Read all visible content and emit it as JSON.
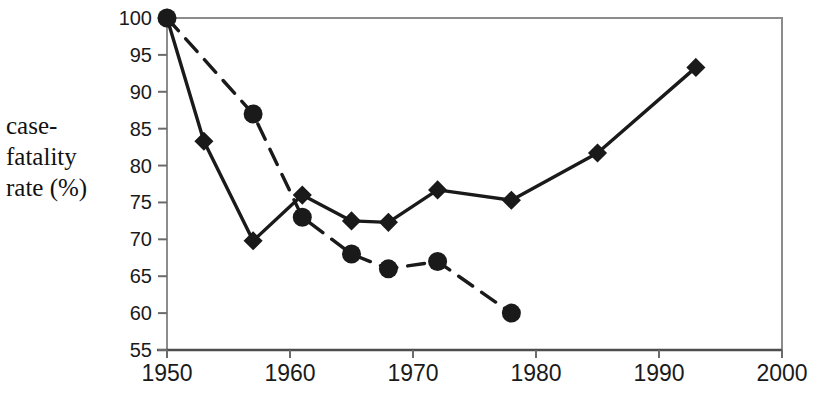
{
  "chart_data": {
    "type": "line",
    "title": "",
    "xlabel": "",
    "ylabel": "case-fatality rate (%)",
    "ylabel_lines": [
      "case-",
      "fatality",
      "rate (%)"
    ],
    "xlim": [
      1950,
      2000
    ],
    "ylim": [
      55,
      100
    ],
    "xticks": [
      1950,
      1960,
      1970,
      1980,
      1990,
      2000
    ],
    "xtick_labels": [
      "1950",
      "1960",
      "1970",
      "1980",
      "1990",
      "2000"
    ],
    "yticks": [
      55,
      60,
      65,
      70,
      75,
      80,
      85,
      90,
      95,
      100
    ],
    "ytick_labels": [
      "55",
      "60",
      "65",
      "70",
      "75",
      "80",
      "85",
      "90",
      "95",
      "100"
    ],
    "grid": false,
    "legend": "none",
    "series": [
      {
        "name": "solid-diamond-series",
        "marker": "diamond",
        "line_style": "solid",
        "color": "#1a1a1a",
        "points": [
          {
            "x": 1950,
            "y": 100
          },
          {
            "x": 1953,
            "y": 83.3
          },
          {
            "x": 1957,
            "y": 69.8
          },
          {
            "x": 1961,
            "y": 76.0
          },
          {
            "x": 1965,
            "y": 72.5
          },
          {
            "x": 1968,
            "y": 72.3
          },
          {
            "x": 1972,
            "y": 76.7
          },
          {
            "x": 1978,
            "y": 75.3
          },
          {
            "x": 1985,
            "y": 81.7
          },
          {
            "x": 1993,
            "y": 93.3
          }
        ]
      },
      {
        "name": "dashed-circle-series",
        "marker": "circle",
        "line_style": "dashed",
        "color": "#1a1a1a",
        "points": [
          {
            "x": 1950,
            "y": 100
          },
          {
            "x": 1957,
            "y": 87.0
          },
          {
            "x": 1961,
            "y": 73.0
          },
          {
            "x": 1965,
            "y": 68.0
          },
          {
            "x": 1968,
            "y": 66.0
          },
          {
            "x": 1972,
            "y": 67.0
          },
          {
            "x": 1978,
            "y": 60.0
          }
        ]
      }
    ]
  },
  "plot": {
    "left": 167,
    "right": 782,
    "top": 18,
    "bottom": 350,
    "frame_color": "#8c8c8c",
    "ink_color": "#1a1a1a"
  }
}
